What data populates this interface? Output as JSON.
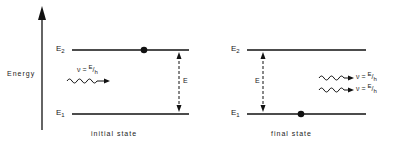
{
  "axis": {
    "label": "Energy",
    "icon": "up-arrow-icon"
  },
  "levels": {
    "upper": "E",
    "upper_sub": "2",
    "lower": "E",
    "lower_sub": "1"
  },
  "gap_label": "E",
  "photon_equation": {
    "nu": "ν =",
    "num": "E",
    "den": "h"
  },
  "initial_state": {
    "caption": "initial state",
    "electron_level": "E2",
    "incoming_photons": 1
  },
  "final_state": {
    "caption": "final state",
    "electron_level": "E1",
    "outgoing_photons": 2
  },
  "colors": {
    "ink": "#111111",
    "background": "#ffffff"
  }
}
